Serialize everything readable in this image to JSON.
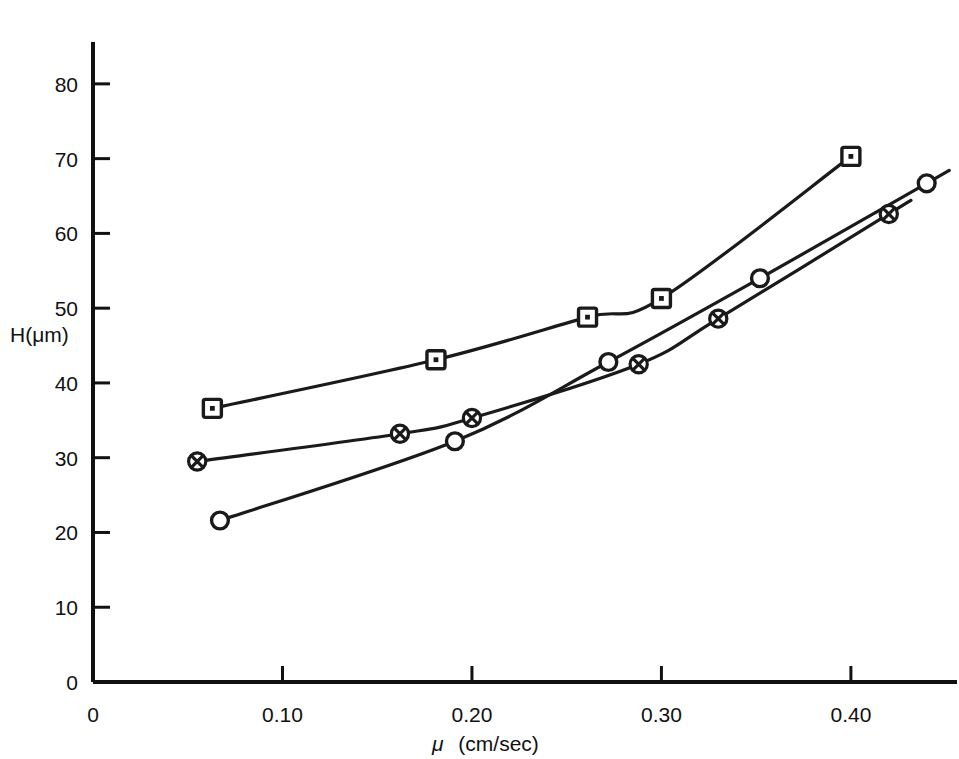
{
  "chart_data": {
    "type": "scatter",
    "title": "",
    "subtitle": "",
    "xlabel": "μ  (cm/sec)",
    "ylabel": "H(μm)",
    "xlim": [
      0,
      0.456
    ],
    "ylim": [
      0,
      85.6
    ],
    "grid": false,
    "legend_position": "none",
    "x_ticks": [
      0,
      0.1,
      0.2,
      0.3,
      0.4
    ],
    "x_tick_labels": [
      "0",
      "0.10",
      "0.20",
      "0.30",
      "0.40"
    ],
    "y_ticks": [
      0,
      10,
      20,
      30,
      40,
      50,
      60,
      70,
      80
    ],
    "y_tick_labels": [
      "0",
      "10",
      "20",
      "30",
      "40",
      "50",
      "60",
      "70",
      "80"
    ],
    "series": [
      {
        "name": "series-square-dot",
        "marker": "square-dot",
        "points": [
          {
            "x": 0.063,
            "y": 36.6
          },
          {
            "x": 0.181,
            "y": 43.1
          },
          {
            "x": 0.261,
            "y": 48.8
          },
          {
            "x": 0.3,
            "y": 51.3
          },
          {
            "x": 0.4,
            "y": 70.3
          }
        ]
      },
      {
        "name": "series-crossed-circle",
        "marker": "crossed-circle",
        "points": [
          {
            "x": 0.055,
            "y": 29.5
          },
          {
            "x": 0.162,
            "y": 33.2
          },
          {
            "x": 0.2,
            "y": 35.3
          },
          {
            "x": 0.288,
            "y": 42.5
          },
          {
            "x": 0.33,
            "y": 48.6
          },
          {
            "x": 0.42,
            "y": 62.6
          }
        ]
      },
      {
        "name": "series-open-circle",
        "marker": "open-circle",
        "points": [
          {
            "x": 0.067,
            "y": 21.6
          },
          {
            "x": 0.191,
            "y": 32.2
          },
          {
            "x": 0.272,
            "y": 42.8
          },
          {
            "x": 0.352,
            "y": 54.0
          },
          {
            "x": 0.44,
            "y": 66.7
          }
        ]
      }
    ],
    "colors": {
      "line": "#1a1a1a",
      "marker": "#1a1a1a",
      "axis": "#111111",
      "background": "#ffffff"
    }
  },
  "axes": {
    "y_axis_title": "H(μm)",
    "x_axis_title_symbol": "μ",
    "x_axis_title_units": "(cm/sec)"
  }
}
